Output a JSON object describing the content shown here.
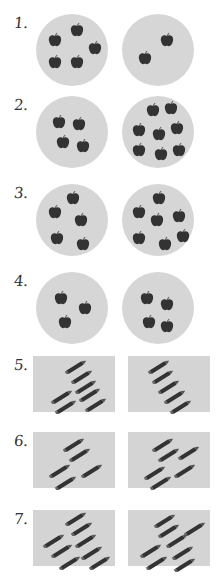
{
  "worksheet": {
    "colors": {
      "shape_bg": "#d6d6d6",
      "item": "#333333",
      "stem": "#666666",
      "label": "#333333"
    },
    "rows": [
      {
        "label": "1.",
        "shape": "circle",
        "item": "apple-icon",
        "left": [
          [
            12,
            18
          ],
          [
            34,
            8
          ],
          [
            52,
            26
          ],
          [
            12,
            40
          ],
          [
            34,
            40
          ]
        ],
        "right": [
          [
            16,
            36
          ],
          [
            38,
            18
          ]
        ]
      },
      {
        "label": "2.",
        "shape": "circle",
        "item": "apple-icon",
        "left": [
          [
            16,
            18
          ],
          [
            36,
            20
          ],
          [
            20,
            38
          ],
          [
            40,
            42
          ]
        ],
        "right": [
          [
            24,
            6
          ],
          [
            42,
            4
          ],
          [
            10,
            26
          ],
          [
            30,
            30
          ],
          [
            48,
            24
          ],
          [
            10,
            46
          ],
          [
            32,
            50
          ],
          [
            50,
            46
          ]
        ]
      },
      {
        "label": "3.",
        "shape": "circle",
        "item": "apple-icon",
        "left": [
          [
            12,
            20
          ],
          [
            30,
            6
          ],
          [
            38,
            28
          ],
          [
            14,
            46
          ],
          [
            40,
            52
          ]
        ],
        "right": [
          [
            10,
            20
          ],
          [
            30,
            6
          ],
          [
            28,
            28
          ],
          [
            50,
            24
          ],
          [
            10,
            46
          ],
          [
            36,
            52
          ],
          [
            54,
            44
          ]
        ]
      },
      {
        "label": "4.",
        "shape": "circle",
        "item": "apple-icon",
        "left": [
          [
            18,
            18
          ],
          [
            42,
            28
          ],
          [
            22,
            42
          ]
        ],
        "right": [
          [
            18,
            18
          ],
          [
            38,
            24
          ],
          [
            20,
            42
          ],
          [
            38,
            46
          ]
        ]
      },
      {
        "label": "5.",
        "shape": "rect",
        "item": "pencil-icon",
        "left": [
          [
            30,
            4
          ],
          [
            36,
            14
          ],
          [
            40,
            24
          ],
          [
            16,
            34
          ],
          [
            44,
            32
          ],
          [
            20,
            44
          ],
          [
            50,
            42
          ]
        ],
        "right": [
          [
            18,
            4
          ],
          [
            22,
            14
          ],
          [
            28,
            24
          ],
          [
            34,
            34
          ],
          [
            40,
            44
          ]
        ]
      },
      {
        "label": "6.",
        "shape": "rect",
        "item": "pencil-icon",
        "left": [
          [
            28,
            6
          ],
          [
            34,
            16
          ],
          [
            14,
            32
          ],
          [
            46,
            32
          ],
          [
            20,
            44
          ]
        ],
        "right": [
          [
            22,
            6
          ],
          [
            28,
            16
          ],
          [
            48,
            14
          ],
          [
            14,
            34
          ],
          [
            44,
            32
          ],
          [
            20,
            44
          ]
        ]
      },
      {
        "label": "7.",
        "shape": "rect",
        "item": "pencil-icon",
        "left": [
          [
            30,
            2
          ],
          [
            36,
            12
          ],
          [
            8,
            24
          ],
          [
            40,
            24
          ],
          [
            16,
            34
          ],
          [
            46,
            36
          ],
          [
            24,
            46
          ],
          [
            54,
            46
          ]
        ],
        "right": [
          [
            24,
            4
          ],
          [
            28,
            14
          ],
          [
            54,
            12
          ],
          [
            10,
            34
          ],
          [
            36,
            24
          ],
          [
            16,
            46
          ],
          [
            42,
            36
          ],
          [
            44,
            48
          ]
        ]
      }
    ]
  }
}
